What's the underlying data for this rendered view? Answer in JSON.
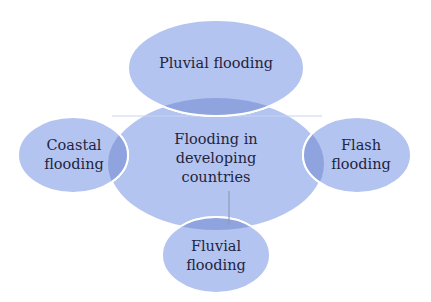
{
  "diagram": {
    "type": "venn-cluster",
    "colors": {
      "ellipse_fill": "#b4c4f0",
      "overlap_fill": "#8fa3df",
      "outline": "#ffffff",
      "text": "#1f2440",
      "connector": "#8f9bb8"
    },
    "center": {
      "lines": [
        "Flooding in",
        "developing",
        "countries"
      ]
    },
    "nodes": {
      "pluvial": {
        "lines": [
          "Pluvial flooding"
        ]
      },
      "coastal": {
        "lines": [
          "Coastal",
          "flooding"
        ]
      },
      "flash": {
        "lines": [
          "Flash",
          "flooding"
        ]
      },
      "fluvial": {
        "lines": [
          "Fluvial",
          "flooding"
        ]
      }
    }
  }
}
